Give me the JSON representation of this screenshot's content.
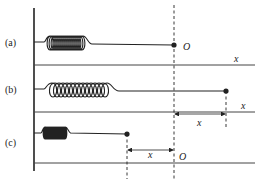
{
  "diagram": {
    "type": "spring-mass-displacement",
    "panels": [
      {
        "id": "a",
        "label": "(a)",
        "state": "equilibrium",
        "origin_label": "O",
        "axis_label": "x"
      },
      {
        "id": "b",
        "label": "(b)",
        "state": "stretched",
        "displacement_label": "x",
        "axis_label": "x"
      },
      {
        "id": "c",
        "label": "(c)",
        "state": "compressed",
        "displacement_label": "x",
        "origin_label": "O"
      }
    ],
    "colors": {
      "ink": "#222222",
      "background": "#ffffff"
    }
  }
}
